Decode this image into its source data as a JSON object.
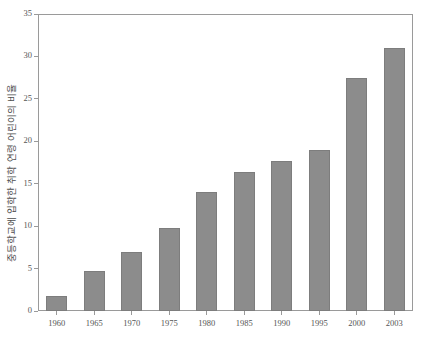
{
  "chart_data": {
    "type": "bar",
    "title": "",
    "subtitle": "",
    "xlabel": "",
    "ylabel": "중등학교에 입학한 취학 연령 어린이의 비율",
    "categories": [
      "1960",
      "1965",
      "1970",
      "1975",
      "1980",
      "1985",
      "1990",
      "1995",
      "2000",
      "2003"
    ],
    "values": [
      1.8,
      4.7,
      7.0,
      9.8,
      14.0,
      16.4,
      17.7,
      19.0,
      27.5,
      31.0
    ],
    "series": [
      {
        "name": "중등학교 입학 비율",
        "values": [
          1.8,
          4.7,
          7.0,
          9.8,
          14.0,
          16.4,
          17.7,
          19.0,
          27.5,
          31.0
        ]
      }
    ],
    "ylim": [
      0,
      35
    ],
    "yticks": [
      0,
      5,
      10,
      15,
      20,
      25,
      30,
      35
    ],
    "ytick_labels": [
      "0",
      "5",
      "10",
      "15",
      "20",
      "25",
      "30",
      "35"
    ],
    "xtick_labels": [
      "1960",
      "1965",
      "1970",
      "1975",
      "1980",
      "1985",
      "1990",
      "1995",
      "2000",
      "2003"
    ],
    "grid": false,
    "legend": null,
    "legend_position": "none",
    "bar_color": "#8c8c8c",
    "bar_edge_color": "#7d7d7d",
    "axis_color": "#9a9a9a",
    "background_color": "#ffffff",
    "annotations": []
  }
}
